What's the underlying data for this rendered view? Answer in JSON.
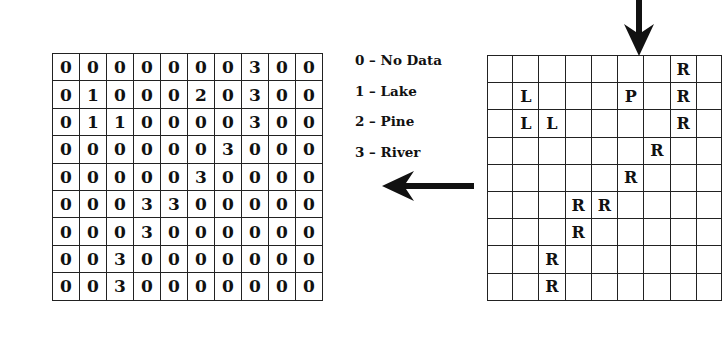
{
  "raster_grid": {
    "rows": [
      [
        "0",
        "0",
        "0",
        "0",
        "0",
        "0",
        "0",
        "3",
        "0",
        "0"
      ],
      [
        "0",
        "1",
        "0",
        "0",
        "0",
        "2",
        "0",
        "3",
        "0",
        "0"
      ],
      [
        "0",
        "1",
        "1",
        "0",
        "0",
        "0",
        "0",
        "3",
        "0",
        "0"
      ],
      [
        "0",
        "0",
        "0",
        "0",
        "0",
        "0",
        "3",
        "0",
        "0",
        "0"
      ],
      [
        "0",
        "0",
        "0",
        "0",
        "0",
        "3",
        "0",
        "0",
        "0",
        "0"
      ],
      [
        "0",
        "0",
        "0",
        "3",
        "3",
        "0",
        "0",
        "0",
        "0",
        "0"
      ],
      [
        "0",
        "0",
        "0",
        "3",
        "0",
        "0",
        "0",
        "0",
        "0",
        "0"
      ],
      [
        "0",
        "0",
        "3",
        "0",
        "0",
        "0",
        "0",
        "0",
        "0",
        "0"
      ],
      [
        "0",
        "0",
        "3",
        "0",
        "0",
        "0",
        "0",
        "0",
        "0",
        "0"
      ]
    ]
  },
  "legend": {
    "items": [
      {
        "label": "0 – No Data"
      },
      {
        "label": "1 – Lake"
      },
      {
        "label": "2 – Pine"
      },
      {
        "label": "3 – River"
      }
    ]
  },
  "feature_grid": {
    "rows": [
      [
        "",
        "",
        "",
        "",
        "",
        "",
        "",
        "R",
        ""
      ],
      [
        "",
        "L",
        "",
        "",
        "",
        "P",
        "",
        "R",
        ""
      ],
      [
        "",
        "L",
        "L",
        "",
        "",
        "",
        "",
        "R",
        ""
      ],
      [
        "",
        "",
        "",
        "",
        "",
        "",
        "R",
        "",
        ""
      ],
      [
        "",
        "",
        "",
        "",
        "",
        "R",
        "",
        "",
        ""
      ],
      [
        "",
        "",
        "",
        "R",
        "R",
        "",
        "",
        "",
        ""
      ],
      [
        "",
        "",
        "",
        "R",
        "",
        "",
        "",
        "",
        ""
      ],
      [
        "",
        "",
        "R",
        "",
        "",
        "",
        "",
        "",
        ""
      ],
      [
        "",
        "",
        "R",
        "",
        "",
        "",
        "",
        "",
        ""
      ]
    ]
  },
  "arrows": {
    "down": {
      "direction": "down"
    },
    "left": {
      "direction": "left"
    }
  }
}
